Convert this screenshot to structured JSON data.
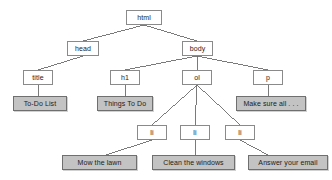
{
  "diagram": {
    "type": "tree",
    "colors": {
      "element_box_fill": "#ffffff",
      "element_box_border": "#8a8a8a",
      "text_box_fill": "#c3c3c3",
      "text_box_border": "#6f6f6f",
      "edge": "#6b6b6b",
      "background": "#ffffff",
      "label": "#1b1b1b"
    },
    "nodes": [
      {
        "id": "html",
        "label": "html",
        "kind": "element",
        "x": 126,
        "y": 10,
        "w": 36,
        "h": 15
      },
      {
        "id": "head",
        "label": "head",
        "kind": "element",
        "x": 67,
        "y": 41,
        "w": 32,
        "h": 15
      },
      {
        "id": "body",
        "label": "body",
        "kind": "element",
        "x": 182,
        "y": 41,
        "w": 31,
        "h": 15
      },
      {
        "id": "title",
        "label": "title",
        "kind": "element",
        "x": 23,
        "y": 70,
        "w": 30,
        "h": 15
      },
      {
        "id": "h1",
        "label": "h1",
        "kind": "element",
        "x": 110,
        "y": 70,
        "w": 30,
        "h": 15
      },
      {
        "id": "ol",
        "label": "ol",
        "kind": "element",
        "x": 182,
        "y": 70,
        "w": 30,
        "h": 15
      },
      {
        "id": "p",
        "label": "p",
        "kind": "element",
        "x": 253,
        "y": 70,
        "w": 30,
        "h": 15
      },
      {
        "id": "todo",
        "label": "To-Do List",
        "kind": "text",
        "x": 13,
        "y": 96,
        "w": 54,
        "h": 15
      },
      {
        "id": "things",
        "label": "Things To Do",
        "kind": "text",
        "x": 97,
        "y": 96,
        "w": 56,
        "h": 15
      },
      {
        "id": "make",
        "label": "Make sure all . . .",
        "kind": "text",
        "x": 236,
        "y": 96,
        "w": 70,
        "h": 15
      },
      {
        "id": "li1",
        "label": "li",
        "kind": "element",
        "x": 137,
        "y": 125,
        "w": 30,
        "h": 15
      },
      {
        "id": "li2",
        "label": "li",
        "kind": "element",
        "x": 180,
        "y": 125,
        "w": 30,
        "h": 15
      },
      {
        "id": "li3",
        "label": "li",
        "kind": "element",
        "x": 225,
        "y": 125,
        "w": 30,
        "h": 15
      },
      {
        "id": "mow",
        "label": "Mow the lawn",
        "kind": "text",
        "x": 62,
        "y": 155,
        "w": 75,
        "h": 15
      },
      {
        "id": "clean",
        "label": "Clean the windows",
        "kind": "text",
        "x": 152,
        "y": 155,
        "w": 83,
        "h": 15
      },
      {
        "id": "answer",
        "label": "Answer your email",
        "kind": "text",
        "x": 248,
        "y": 155,
        "w": 80,
        "h": 15
      }
    ],
    "edges": [
      {
        "from": "html",
        "to": "head",
        "x1": 144,
        "y1": 25,
        "x2": 83,
        "y2": 41
      },
      {
        "from": "html",
        "to": "body",
        "x1": 144,
        "y1": 25,
        "x2": 197,
        "y2": 41
      },
      {
        "from": "head",
        "to": "title",
        "x1": 83,
        "y1": 56,
        "x2": 38,
        "y2": 70
      },
      {
        "from": "body",
        "to": "h1",
        "x1": 197,
        "y1": 56,
        "x2": 125,
        "y2": 70
      },
      {
        "from": "body",
        "to": "ol",
        "x1": 197,
        "y1": 56,
        "x2": 197,
        "y2": 70
      },
      {
        "from": "body",
        "to": "p",
        "x1": 197,
        "y1": 56,
        "x2": 268,
        "y2": 70
      },
      {
        "from": "title",
        "to": "todo",
        "x1": 38,
        "y1": 85,
        "x2": 38,
        "y2": 96
      },
      {
        "from": "h1",
        "to": "things",
        "x1": 125,
        "y1": 85,
        "x2": 125,
        "y2": 96
      },
      {
        "from": "p",
        "to": "make",
        "x1": 268,
        "y1": 85,
        "x2": 268,
        "y2": 96
      },
      {
        "from": "ol",
        "to": "li1",
        "x1": 197,
        "y1": 85,
        "x2": 152,
        "y2": 125
      },
      {
        "from": "ol",
        "to": "li2",
        "x1": 197,
        "y1": 85,
        "x2": 195,
        "y2": 125
      },
      {
        "from": "ol",
        "to": "li3",
        "x1": 197,
        "y1": 85,
        "x2": 240,
        "y2": 125
      },
      {
        "from": "li1",
        "to": "mow",
        "x1": 152,
        "y1": 140,
        "x2": 106,
        "y2": 155
      },
      {
        "from": "li2",
        "to": "clean",
        "x1": 195,
        "y1": 140,
        "x2": 195,
        "y2": 155
      },
      {
        "from": "li3",
        "to": "answer",
        "x1": 240,
        "y1": 140,
        "x2": 268,
        "y2": 155
      }
    ]
  }
}
